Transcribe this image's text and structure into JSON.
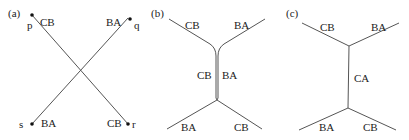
{
  "panels": [
    {
      "label": "(a)",
      "points": {
        "p": "p",
        "q": "q",
        "r": "r",
        "s": "s"
      },
      "edge_labels": {
        "top_left": "CB",
        "top_right": "BA",
        "bottom_left": "BA",
        "bottom_right": "CB"
      }
    },
    {
      "label": "(b)",
      "edge_labels": {
        "top_left": "CB",
        "top_right": "BA",
        "middle_left": "CB",
        "middle_right": "BA",
        "bottom_left": "BA",
        "bottom_right": "CB"
      }
    },
    {
      "label": "(c)",
      "edge_labels": {
        "top_left": "CB",
        "top_right": "BA",
        "middle": "CA",
        "bottom_left": "BA",
        "bottom_right": "CB"
      }
    }
  ],
  "colors": {
    "line": "#555555",
    "text": "#222222"
  }
}
